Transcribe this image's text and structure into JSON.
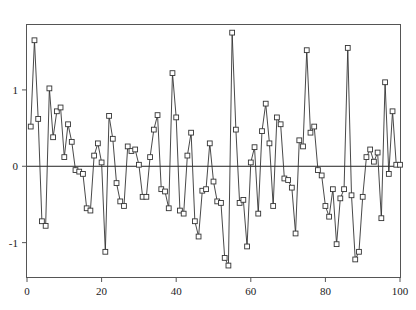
{
  "chart_data": {
    "type": "line",
    "title": "",
    "subtitle": "",
    "xlabel": "",
    "ylabel": "",
    "xlim": [
      0,
      100
    ],
    "ylim": [
      -1.45,
      1.85
    ],
    "grid": false,
    "legend": null,
    "marker": "open-square",
    "line_color": "#333333",
    "marker_edge_color": "#333333",
    "marker_face_color": "#ffffff",
    "reference_line": {
      "axis": "y",
      "value": 0,
      "color": "#222222"
    },
    "xticks": [
      0,
      20,
      40,
      60,
      80,
      100
    ],
    "xtick_labels": [
      "0",
      "20",
      "40",
      "60",
      "80",
      "100"
    ],
    "yticks": [
      1,
      0,
      -1
    ],
    "ytick_labels": [
      "1",
      "0",
      "-1"
    ],
    "x": [
      1,
      2,
      3,
      4,
      5,
      6,
      7,
      8,
      9,
      10,
      11,
      12,
      13,
      14,
      15,
      16,
      17,
      18,
      19,
      20,
      21,
      22,
      23,
      24,
      25,
      26,
      27,
      28,
      29,
      30,
      31,
      32,
      33,
      34,
      35,
      36,
      37,
      38,
      39,
      40,
      41,
      42,
      43,
      44,
      45,
      46,
      47,
      48,
      49,
      50,
      51,
      52,
      53,
      54,
      55,
      56,
      57,
      58,
      59,
      60,
      61,
      62,
      63,
      64,
      65,
      66,
      67,
      68,
      69,
      70,
      71,
      72,
      73,
      74,
      75,
      76,
      77,
      78,
      79,
      80,
      81,
      82,
      83,
      84,
      85,
      86,
      87,
      88,
      89,
      90,
      91,
      92,
      93,
      94,
      95,
      96,
      97,
      98,
      99,
      100
    ],
    "values": [
      0.52,
      1.65,
      0.62,
      -0.72,
      -0.78,
      1.02,
      0.38,
      0.72,
      0.77,
      0.12,
      0.55,
      0.32,
      -0.05,
      -0.07,
      -0.1,
      -0.55,
      -0.58,
      0.14,
      0.3,
      0.05,
      -1.12,
      0.66,
      0.36,
      -0.22,
      -0.46,
      -0.52,
      0.26,
      0.2,
      0.22,
      0.02,
      -0.4,
      -0.4,
      0.12,
      0.48,
      0.67,
      -0.3,
      -0.33,
      -0.55,
      1.22,
      0.64,
      -0.58,
      -0.62,
      0.14,
      0.44,
      -0.72,
      -0.92,
      -0.32,
      -0.3,
      0.3,
      -0.2,
      -0.46,
      -0.48,
      -1.2,
      -1.3,
      1.75,
      0.48,
      -0.48,
      -0.44,
      -1.05,
      0.05,
      0.25,
      -0.62,
      0.46,
      0.82,
      0.3,
      -0.52,
      0.64,
      0.55,
      -0.16,
      -0.18,
      -0.28,
      -0.88,
      0.34,
      0.26,
      1.52,
      0.44,
      0.52,
      -0.05,
      -0.12,
      -0.52,
      -0.66,
      -0.3,
      -1.02,
      -0.42,
      -0.3,
      1.55,
      -0.38,
      -1.22,
      -1.12,
      -0.4,
      0.12,
      0.22,
      0.06,
      0.18,
      -0.68,
      1.1,
      -0.1,
      0.72,
      0.02,
      0.02
    ]
  },
  "axes": {
    "x_axis_name": "x-axis",
    "y_axis_name": "y-axis"
  }
}
